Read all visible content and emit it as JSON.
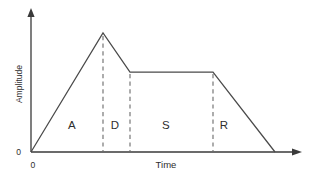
{
  "figure": {
    "name": "adsr-envelope-diagram",
    "background_color": "#ffffff",
    "line_color": "#4a4a4a",
    "axis_color": "#3a3a3a",
    "dash_color": "#6a6a6a",
    "text_color": "#2e2e2e"
  },
  "axes": {
    "y_label": "Amplitude",
    "x_label": "Time",
    "y_origin_tick": "0",
    "x_origin_tick": "0"
  },
  "phases": [
    {
      "key": "attack",
      "label": "A",
      "label_x": 72,
      "label_y": 129
    },
    {
      "key": "decay",
      "label": "D",
      "label_x": 115,
      "label_y": 129
    },
    {
      "key": "sustain",
      "label": "S",
      "label_x": 166,
      "label_y": 129
    },
    {
      "key": "release",
      "label": "R",
      "label_x": 224,
      "label_y": 129
    }
  ],
  "chart_data": {
    "type": "line",
    "title": "",
    "subtitle": "",
    "xlabel": "Time",
    "ylabel": "Amplitude",
    "xlim": [
      0,
      1
    ],
    "ylim": [
      0,
      1
    ],
    "grid": false,
    "legend": "none",
    "annotations": [
      "A",
      "D",
      "S",
      "R"
    ],
    "series": [
      {
        "name": "ADSR envelope",
        "points": [
          {
            "x": 0.0,
            "y": 0.0,
            "phase": "start"
          },
          {
            "x": 0.295,
            "y": 1.0,
            "phase": "attack-peak"
          },
          {
            "x": 0.405,
            "y": 0.67,
            "phase": "decay-end"
          },
          {
            "x": 0.745,
            "y": 0.67,
            "phase": "sustain-end"
          },
          {
            "x": 1.0,
            "y": 0.0,
            "phase": "release-end"
          }
        ]
      }
    ],
    "guides": [
      {
        "name": "attack-decay-boundary",
        "x": 0.295,
        "y_top": 1.0
      },
      {
        "name": "decay-sustain-boundary",
        "x": 0.405,
        "y_top": 0.67
      },
      {
        "name": "sustain-release-boundary",
        "x": 0.745,
        "y_top": 0.67
      }
    ],
    "pixel_geometry": {
      "x_axis_y": 152,
      "y_axis_x": 31,
      "x_axis_arrow_x": 301,
      "y_axis_arrow_y": 10,
      "envelope_points": [
        [
          31,
          152
        ],
        [
          103,
          33
        ],
        [
          130,
          72
        ],
        [
          213,
          72
        ],
        [
          275,
          152
        ]
      ],
      "dash_x": [
        103,
        130,
        213
      ],
      "sustain_level_y": 72,
      "peak_y": 33
    }
  }
}
